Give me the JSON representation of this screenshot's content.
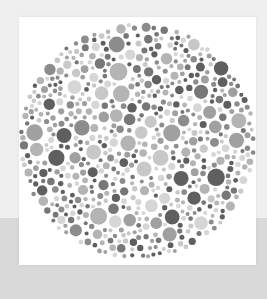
{
  "image": {
    "subject": "Ishihara-style color vision test plate (grayscale)",
    "description": "Circular field of randomly sized dots in varying gray tones on a white card"
  },
  "colors": {
    "page_background": "#efefef",
    "lower_band": "#d9d9d9",
    "card": "#ffffff",
    "dot_tones": [
      "#c8c8c8",
      "#b4b4b4",
      "#a0a0a0",
      "#8c8c8c",
      "#777777",
      "#5f5f5f",
      "#d6d6d6"
    ]
  },
  "plate": {
    "center_x": 118,
    "center_y": 124,
    "radius": 119,
    "dot_count": 900,
    "min_dot_radius": 2,
    "max_dot_radius": 9
  }
}
